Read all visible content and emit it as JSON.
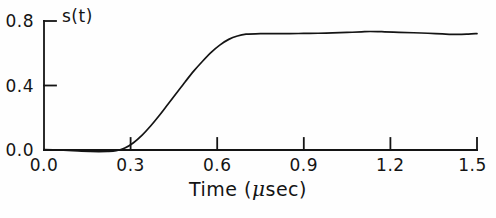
{
  "figure": {
    "background_color": "#fefefe",
    "ink_color": "#141414"
  },
  "axes": {
    "y_axis_label": "s(t)",
    "x_axis_title_prefix": "Time (",
    "x_axis_title_mu": "μ",
    "x_axis_title_suffix": "sec)",
    "x_axis_title_full": "Time (μsec)"
  },
  "chart_data": {
    "type": "line",
    "title": "",
    "subtitle": "",
    "xlabel": "Time (μsec)",
    "ylabel": "s(t)",
    "xlim": [
      0.0,
      1.5
    ],
    "ylim": [
      0.0,
      0.8
    ],
    "xticks": [
      0.0,
      0.3,
      0.6,
      0.9,
      1.2,
      1.5
    ],
    "xticklabels": [
      "0.0",
      "0.3",
      "0.6",
      "0.9",
      "1.2",
      "1.5"
    ],
    "yticks": [
      0.0,
      0.4,
      0.8
    ],
    "yticklabels": [
      "0.0",
      "0.4",
      "0.8"
    ],
    "grid": false,
    "legend": false,
    "legend_position": "none",
    "annotations": [
      {
        "text": "s(t)",
        "x": 0.07,
        "y": 0.8,
        "note": "series label inside plot near top-left"
      }
    ],
    "series": [
      {
        "name": "s(t)",
        "color": "#141414",
        "line_width": 1.6,
        "x": [
          0.0,
          0.05,
          0.1,
          0.13,
          0.16,
          0.19,
          0.22,
          0.25,
          0.28,
          0.31,
          0.34,
          0.37,
          0.4,
          0.43,
          0.46,
          0.49,
          0.52,
          0.55,
          0.58,
          0.61,
          0.64,
          0.67,
          0.7,
          0.75,
          0.8,
          0.85,
          0.9,
          0.95,
          1.0,
          1.05,
          1.1,
          1.13,
          1.18,
          1.23,
          1.28,
          1.33,
          1.38,
          1.43,
          1.47,
          1.5
        ],
        "y": [
          0.003,
          0.0,
          -0.004,
          -0.007,
          -0.009,
          -0.01,
          -0.009,
          -0.004,
          0.012,
          0.045,
          0.092,
          0.15,
          0.215,
          0.285,
          0.355,
          0.425,
          0.492,
          0.552,
          0.607,
          0.652,
          0.686,
          0.707,
          0.718,
          0.722,
          0.722,
          0.722,
          0.723,
          0.724,
          0.726,
          0.729,
          0.733,
          0.735,
          0.733,
          0.73,
          0.727,
          0.724,
          0.72,
          0.717,
          0.719,
          0.722
        ]
      }
    ]
  },
  "y_tick_labels": [
    {
      "text": "0.8",
      "value": 0.8
    },
    {
      "text": "0.4",
      "value": 0.4
    },
    {
      "text": "0.0",
      "value": 0.0
    }
  ],
  "x_tick_labels": [
    {
      "text": "0.0",
      "value": 0.0
    },
    {
      "text": "0.3",
      "value": 0.3
    },
    {
      "text": "0.6",
      "value": 0.6
    },
    {
      "text": "0.9",
      "value": 0.9
    },
    {
      "text": "1.2",
      "value": 1.2
    },
    {
      "text": "1.5",
      "value": 1.5
    }
  ]
}
